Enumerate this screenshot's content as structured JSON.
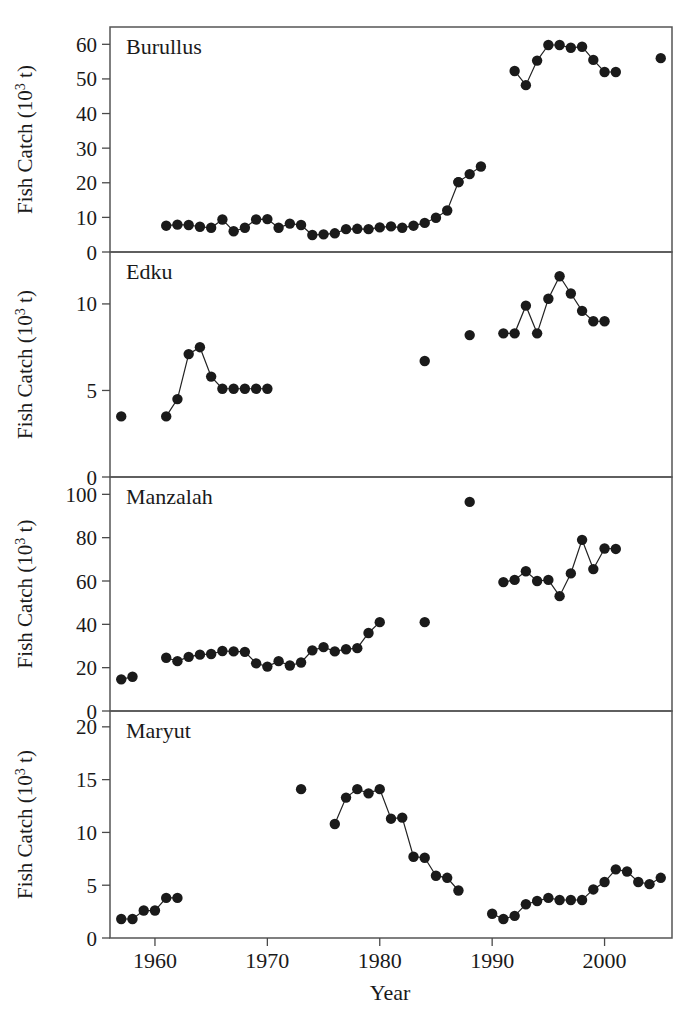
{
  "figure": {
    "xlabel": "Year",
    "x_tick_labels": [
      "1960",
      "1970",
      "1980",
      "1990",
      "2000"
    ],
    "x_ticks": [
      1960,
      1970,
      1980,
      1990,
      2000
    ],
    "xlim": [
      1956,
      2006
    ]
  },
  "panels": {
    "burullus": {
      "title": "Burullus",
      "ylabel_text": "Fish Catch (10",
      "ylabel_sup": "3",
      "ylabel_tail": " t)",
      "y_tick_labels": [
        "0",
        "10",
        "20",
        "30",
        "40",
        "50",
        "60"
      ]
    },
    "edku": {
      "title": "Edku",
      "ylabel_text": "Fish Catch (10",
      "ylabel_sup": "3",
      "ylabel_tail": " t)",
      "y_tick_labels": [
        "0",
        "5",
        "10"
      ]
    },
    "manzalah": {
      "title": "Manzalah",
      "ylabel_text": "Fish Catch (10",
      "ylabel_sup": "3",
      "ylabel_tail": " t)",
      "y_tick_labels": [
        "0",
        "20",
        "40",
        "60",
        "80",
        "100"
      ]
    },
    "maryut": {
      "title": "Maryut",
      "ylabel_text": "Fish Catch (10",
      "ylabel_sup": "3",
      "ylabel_tail": " t)",
      "y_tick_labels": [
        "0",
        "5",
        "10",
        "15",
        "20"
      ]
    }
  },
  "chart_data": [
    {
      "type": "scatter",
      "title": "Burullus",
      "xlabel": "Year",
      "ylabel": "Fish Catch (10^3 t)",
      "xlim": [
        1956,
        2006
      ],
      "ylim": [
        0,
        65
      ],
      "yticks": [
        0,
        10,
        20,
        30,
        40,
        50,
        60
      ],
      "grid": false,
      "legend": "none",
      "segments": [
        {
          "x": [
            1961,
            1962,
            1963,
            1964,
            1965,
            1966,
            1967,
            1968,
            1969,
            1970,
            1971,
            1972,
            1973,
            1974,
            1975,
            1976,
            1977,
            1978,
            1979,
            1980,
            1981,
            1982,
            1983,
            1984,
            1985,
            1986,
            1987
          ],
          "y": [
            7.6,
            7.9,
            7.8,
            7.3,
            7.0,
            9.4,
            6.0,
            7.0,
            9.4,
            9.5,
            7.0,
            8.2,
            7.8,
            4.9,
            5.1,
            5.4,
            6.6,
            6.7,
            6.6,
            7.1,
            7.4,
            7.0,
            7.6,
            8.4,
            9.9,
            12.0,
            20.2
          ]
        },
        {
          "x": [
            1987,
            1988,
            1989
          ],
          "y": [
            20.2,
            22.5,
            24.7
          ]
        },
        {
          "x": [
            1992,
            1993,
            1994,
            1995,
            1996,
            1997,
            1998,
            1999,
            2000,
            2001
          ],
          "y": [
            52.3,
            48.2,
            55.3,
            59.8,
            59.8,
            59.0,
            59.3,
            55.5,
            52.0,
            52.0
          ]
        },
        {
          "x": [
            2005
          ],
          "y": [
            56.0
          ]
        }
      ]
    },
    {
      "type": "scatter",
      "title": "Edku",
      "xlabel": "Year",
      "ylabel": "Fish Catch (10^3 t)",
      "xlim": [
        1956,
        2006
      ],
      "ylim": [
        0,
        13
      ],
      "yticks": [
        0,
        5,
        10
      ],
      "grid": false,
      "legend": "none",
      "segments": [
        {
          "x": [
            1957
          ],
          "y": [
            3.5
          ]
        },
        {
          "x": [
            1961,
            1962,
            1963,
            1964,
            1965,
            1966,
            1967,
            1968,
            1969,
            1970
          ],
          "y": [
            3.5,
            4.5,
            7.1,
            7.5,
            5.8,
            5.1,
            5.1,
            5.1,
            5.1,
            5.1
          ]
        },
        {
          "x": [
            1984
          ],
          "y": [
            6.7
          ]
        },
        {
          "x": [
            1988
          ],
          "y": [
            8.2
          ]
        },
        {
          "x": [
            1991,
            1992,
            1993,
            1994,
            1995,
            1996,
            1997,
            1998,
            1999,
            2000
          ],
          "y": [
            8.3,
            8.3,
            9.9,
            8.3,
            10.3,
            11.6,
            10.6,
            9.6,
            9.0,
            9.0
          ]
        }
      ]
    },
    {
      "type": "scatter",
      "title": "Manzalah",
      "xlabel": "Year",
      "ylabel": "Fish Catch (10^3 t)",
      "xlim": [
        1956,
        2006
      ],
      "ylim": [
        0,
        108
      ],
      "yticks": [
        0,
        20,
        40,
        60,
        80,
        100
      ],
      "grid": false,
      "legend": "none",
      "segments": [
        {
          "x": [
            1957,
            1958
          ],
          "y": [
            14.6,
            15.8
          ]
        },
        {
          "x": [
            1961,
            1962,
            1963,
            1964,
            1965,
            1966,
            1967,
            1968,
            1969,
            1970,
            1971,
            1972,
            1973,
            1974,
            1975,
            1976,
            1977,
            1978,
            1979,
            1980
          ],
          "y": [
            24.6,
            23.0,
            25.0,
            26.0,
            26.3,
            27.7,
            27.5,
            27.3,
            22.0,
            20.5,
            23.0,
            21.0,
            22.4,
            28.0,
            29.5,
            27.5,
            28.5,
            29.0,
            36.0,
            41.0
          ]
        },
        {
          "x": [
            1984
          ],
          "y": [
            41.0
          ]
        },
        {
          "x": [
            1988
          ],
          "y": [
            96.5
          ]
        },
        {
          "x": [
            1991,
            1992,
            1993,
            1994,
            1995,
            1996,
            1997,
            1998,
            1999,
            2000,
            2001
          ],
          "y": [
            59.5,
            60.5,
            64.5,
            60.0,
            60.5,
            53.0,
            63.5,
            79.0,
            65.5,
            75.0,
            74.8
          ]
        }
      ]
    },
    {
      "type": "scatter",
      "title": "Maryut",
      "xlabel": "Year",
      "ylabel": "Fish Catch (10^3 t)",
      "xlim": [
        1956,
        2006
      ],
      "ylim": [
        0,
        21.5
      ],
      "yticks": [
        0,
        5,
        10,
        15,
        20
      ],
      "grid": false,
      "legend": "none",
      "segments": [
        {
          "x": [
            1957,
            1958,
            1959,
            1960,
            1961,
            1962
          ],
          "y": [
            1.8,
            1.8,
            2.6,
            2.6,
            3.8,
            3.8
          ]
        },
        {
          "x": [
            1973
          ],
          "y": [
            14.1
          ]
        },
        {
          "x": [
            1976,
            1977,
            1978,
            1979,
            1980,
            1981,
            1982,
            1983,
            1984,
            1985,
            1986,
            1987
          ],
          "y": [
            10.8,
            13.3,
            14.1,
            13.7,
            14.1,
            11.3,
            11.4,
            7.7,
            7.6,
            5.9,
            5.7,
            4.5
          ]
        },
        {
          "x": [
            1990,
            1991,
            1992,
            1993,
            1994,
            1995,
            1996,
            1997,
            1998,
            1999,
            2000,
            2001,
            2002,
            2003,
            2004,
            2005
          ],
          "y": [
            2.3,
            1.8,
            2.1,
            3.2,
            3.5,
            3.8,
            3.6,
            3.6,
            3.6,
            4.6,
            5.3,
            6.5,
            6.3,
            5.3,
            5.1,
            5.7
          ]
        }
      ]
    }
  ]
}
